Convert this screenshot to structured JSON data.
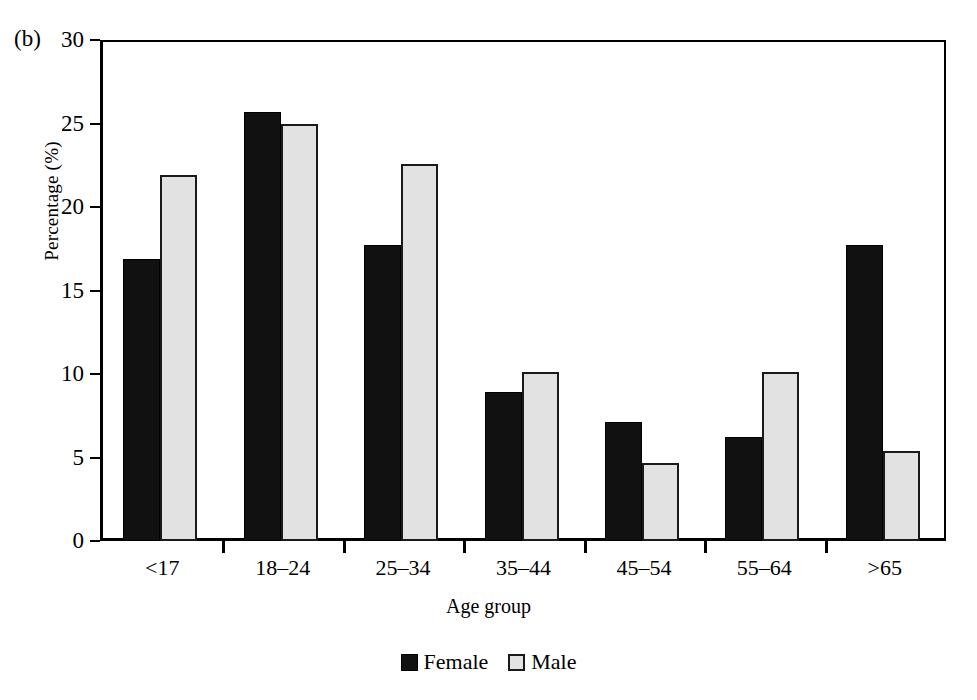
{
  "panel_label": "(b)",
  "chart_data": {
    "type": "bar",
    "title": "",
    "xlabel": "Age group",
    "ylabel": "Percentage (%)",
    "ylim": [
      0,
      30
    ],
    "yticks": [
      0,
      5,
      10,
      15,
      20,
      25,
      30
    ],
    "ytick_labels": [
      "0",
      "5",
      "10",
      "15",
      "20",
      "25",
      "30"
    ],
    "grid": false,
    "legend_position": "bottom-center",
    "categories": [
      "<17",
      "18–24",
      "25–34",
      "35–44",
      "45–54",
      "55–64",
      ">65"
    ],
    "series": [
      {
        "name": "Female",
        "color": "#111111",
        "values": [
          16.9,
          25.7,
          17.7,
          8.9,
          7.1,
          6.2,
          17.7
        ]
      },
      {
        "name": "Male",
        "color": "#e2e2e2",
        "values": [
          21.9,
          25.0,
          22.6,
          10.1,
          4.7,
          10.1,
          5.4
        ]
      }
    ]
  }
}
